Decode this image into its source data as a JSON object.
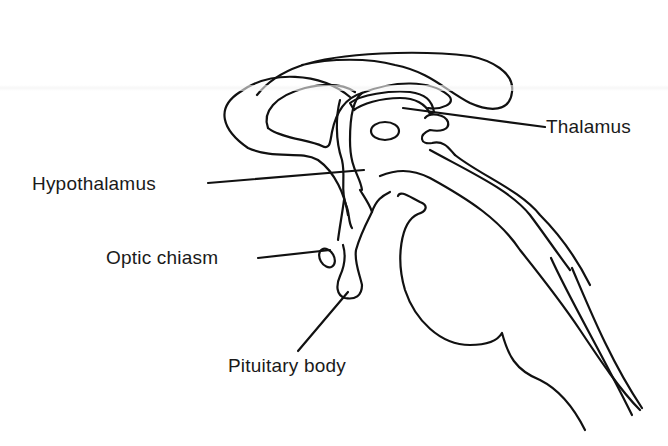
{
  "diagram": {
    "labels": [
      {
        "id": "thalamus",
        "text": "Thalamus",
        "x": 546,
        "y": 116
      },
      {
        "id": "hypothalamus",
        "text": "Hypothalamus",
        "x": 32,
        "y": 173
      },
      {
        "id": "optic-chiasm",
        "text": "Optic chiasm",
        "x": 106,
        "y": 247
      },
      {
        "id": "pituitary-body",
        "text": "Pituitary body",
        "x": 228,
        "y": 355
      }
    ],
    "stroke_color": "#111111",
    "background_color": "#ffffff",
    "text_color": "#1a1a1a"
  }
}
